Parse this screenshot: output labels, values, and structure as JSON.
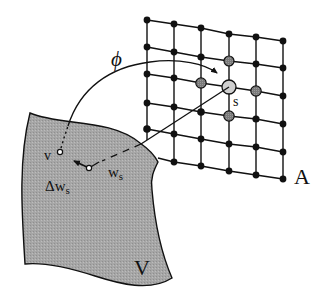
{
  "figure": {
    "labels": {
      "phi": "ϕ",
      "s": "s",
      "A": "A",
      "V": "V",
      "v": "v",
      "ws_base": "w",
      "ws_sub": "s",
      "dws_base": "Δw",
      "dws_sub": "s"
    },
    "colors": {
      "line": "#111111",
      "node": "#111111",
      "neighbor_fill": "#8a8a8a",
      "winner_fill": "#c8c8c8",
      "space_fill": "#a9a9a9",
      "background": "#ffffff"
    },
    "lattice": {
      "columns": 6,
      "rows": 6,
      "winner": {
        "col": 3,
        "row": 2
      },
      "neighbors": [
        {
          "col": 3,
          "row": 1
        },
        {
          "col": 2,
          "row": 2
        },
        {
          "col": 4,
          "row": 2
        },
        {
          "col": 3,
          "row": 3
        }
      ]
    }
  }
}
